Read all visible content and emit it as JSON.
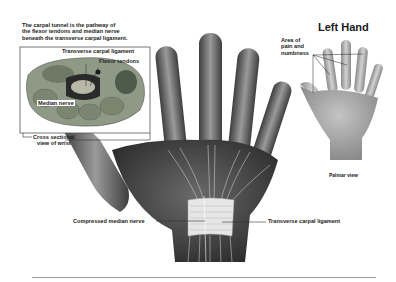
{
  "illustration": {
    "subject": "Carpal tunnel syndrome anatomy",
    "intro_text": [
      "The carpal tunnel is the pathway of",
      "the flexor tendons and median nerve",
      "beneath the transverse carpal ligament."
    ],
    "inset": {
      "labels": {
        "transverse_ligament": "Transverse carpal ligament",
        "flexor_tendons": "Flexor tendons",
        "median_nerve": "Median nerve"
      },
      "caption": [
        "Cross sectional",
        "view of wrist"
      ]
    },
    "main_hand": {
      "left_label": "Compressed median nerve",
      "right_label": "Transverse carpal ligament"
    },
    "side_panel": {
      "title": "Left Hand",
      "area_label": [
        "Area of",
        "pain and",
        "numbness"
      ],
      "caption": "Palmar view"
    }
  },
  "colors": {
    "background": "#ffffff",
    "skin_dark": "#4a4a4a",
    "skin_mid": "#8a8a8a",
    "skin_light": "#c8c8c8",
    "ligament": "#e6e6e6",
    "tissue_green": "#8f9a86",
    "rule": "#9a9a9a"
  }
}
